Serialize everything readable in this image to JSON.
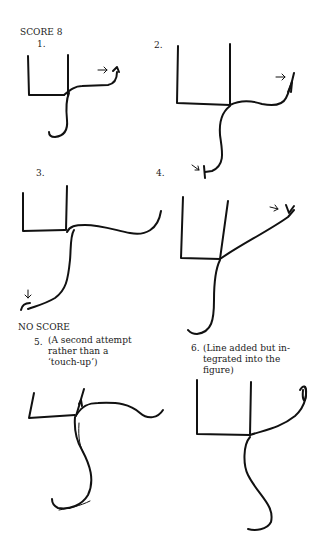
{
  "headings": {
    "score": "SCORE 8",
    "no_score": "NO SCORE"
  },
  "figures": [
    {
      "number": "1.",
      "caption": ""
    },
    {
      "number": "2.",
      "caption": ""
    },
    {
      "number": "3.",
      "caption": ""
    },
    {
      "number": "4.",
      "caption": ""
    },
    {
      "number": "5.",
      "caption": "(A second attempt\nrather than a\n‘touch-up’)"
    },
    {
      "number": "6.",
      "caption": "(Line added but in-\ntegrated into the\nfigure)"
    }
  ],
  "icons": [
    "arrow-marker-icon"
  ]
}
